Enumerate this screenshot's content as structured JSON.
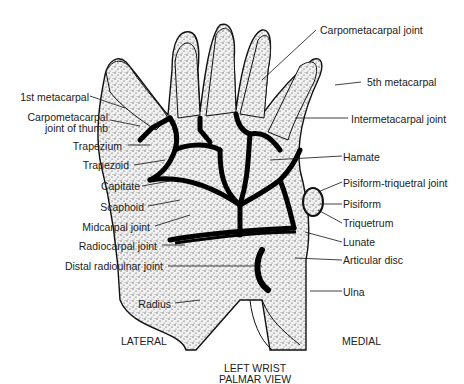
{
  "diagram": {
    "title_line1": "LEFT WRIST",
    "title_line2": "PALMAR VIEW",
    "side_left": "LATERAL",
    "side_right": "MEDIAL",
    "labels_left": [
      {
        "text": "1st metacarpal"
      },
      {
        "text": "Carpometacarpal"
      },
      {
        "text": "joint of thumb"
      },
      {
        "text": "Trapezium"
      },
      {
        "text": "Trapezoid"
      },
      {
        "text": "Capitate"
      },
      {
        "text": "Scaphoid"
      },
      {
        "text": "Midcarpal joint"
      },
      {
        "text": "Radiocarpal joint"
      },
      {
        "text": "Distal radioulnar joint"
      },
      {
        "text": "Radius"
      }
    ],
    "labels_right": [
      {
        "text": "Carpometacarpal joint"
      },
      {
        "text": "5th metacarpal"
      },
      {
        "text": "Intermetacarpal joint"
      },
      {
        "text": "Hamate"
      },
      {
        "text": "Pisiform-triquetral joint"
      },
      {
        "text": "Pisiform"
      },
      {
        "text": "Triquetrum"
      },
      {
        "text": "Lunate"
      },
      {
        "text": "Articular disc"
      },
      {
        "text": "Ulna"
      }
    ]
  }
}
